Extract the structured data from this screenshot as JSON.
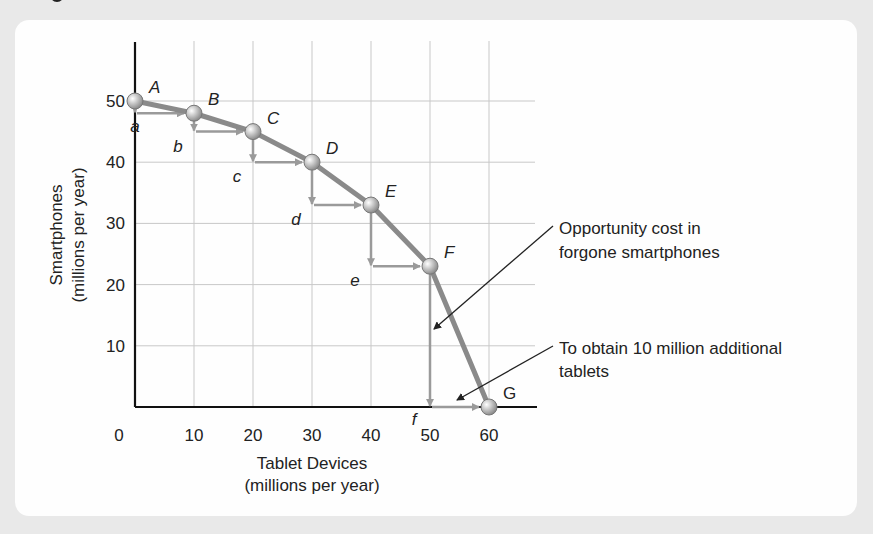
{
  "chart_data": {
    "type": "line",
    "title": "",
    "xlabel": "Tablet Devices (millions per year)",
    "ylabel": "Smartphones (millions per year)",
    "xlabel_lines": [
      "Tablet Devices",
      "(millions per year)"
    ],
    "ylabel_lines": [
      "Smartphones",
      "(millions per year)"
    ],
    "xlim": [
      0,
      60
    ],
    "ylim": [
      0,
      50
    ],
    "x_ticks": [
      0,
      10,
      20,
      30,
      40,
      50,
      60
    ],
    "y_ticks": [
      10,
      20,
      30,
      40,
      50
    ],
    "grid": true,
    "series": [
      {
        "name": "Production possibilities curve",
        "points": [
          {
            "label": "A",
            "x": 0,
            "y": 50
          },
          {
            "label": "B",
            "x": 10,
            "y": 48
          },
          {
            "label": "C",
            "x": 20,
            "y": 45
          },
          {
            "label": "D",
            "x": 30,
            "y": 40
          },
          {
            "label": "E",
            "x": 40,
            "y": 33
          },
          {
            "label": "F",
            "x": 50,
            "y": 23
          },
          {
            "label": "G",
            "x": 60,
            "y": 0
          }
        ]
      }
    ],
    "step_labels": [
      "a",
      "b",
      "c",
      "d",
      "e",
      "f"
    ],
    "annotations": [
      {
        "text_lines": [
          "Opportunity cost in",
          "forgone smartphones"
        ],
        "points_to": "vertical drop F to f"
      },
      {
        "text_lines": [
          "To obtain 10 million additional",
          "tablets"
        ],
        "points_to": "horizontal step f to G"
      }
    ],
    "colors": {
      "curve": "#8a8a8a",
      "axis": "#111111",
      "grid": "#c8c8c8",
      "arrow": "#9a9a9a",
      "leader": "#222222"
    }
  }
}
